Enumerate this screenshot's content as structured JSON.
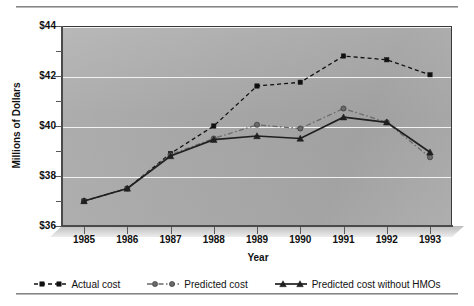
{
  "chart_data": {
    "type": "line",
    "title": "",
    "xlabel": "Year",
    "ylabel": "Millions of Dollars",
    "x": [
      1985,
      1986,
      1987,
      1988,
      1989,
      1990,
      1991,
      1992,
      1993
    ],
    "categories": [
      "1985",
      "1986",
      "1987",
      "1988",
      "1989",
      "1990",
      "1991",
      "1992",
      "1993"
    ],
    "xtick_labels": [
      "1985",
      "1986",
      "1987",
      "1988",
      "1989",
      "1990",
      "1991",
      "1992",
      "1993"
    ],
    "ytick_labels": [
      "$36",
      "$38",
      "$40",
      "$42",
      "$44"
    ],
    "ytick_values": [
      36,
      38,
      40,
      42,
      44
    ],
    "yminor_values": [
      37,
      39,
      41,
      43
    ],
    "ylim": [
      36,
      44
    ],
    "xlim": [
      1984.6,
      1993.5
    ],
    "grid": "horizontal",
    "legend_position": "bottom",
    "plot_background": "#a8a8a8",
    "series": [
      {
        "name": "Actual cost",
        "marker": "square",
        "linestyle": "dashed",
        "color": "#101010",
        "values": [
          37.0,
          37.5,
          38.9,
          40.0,
          41.6,
          41.75,
          42.8,
          42.65,
          42.05
        ]
      },
      {
        "name": "Predicted cost",
        "marker": "circle",
        "linestyle": "dash-dot",
        "color": "#6a6a6a",
        "values": [
          37.0,
          37.5,
          38.85,
          39.5,
          40.05,
          39.9,
          40.7,
          40.15,
          38.75
        ]
      },
      {
        "name": "Predicted cost without HMOs",
        "marker": "triangle",
        "linestyle": "solid",
        "color": "#202020",
        "values": [
          37.0,
          37.5,
          38.8,
          39.45,
          39.6,
          39.5,
          40.35,
          40.15,
          38.95
        ]
      }
    ]
  },
  "axes": {
    "y_title": "Millions of Dollars",
    "x_title": "Year"
  },
  "legend": {
    "items": [
      {
        "label": "Actual cost",
        "marker": "square",
        "linestyle": "dashed",
        "color": "#101010"
      },
      {
        "label": "Predicted cost",
        "marker": "circle",
        "linestyle": "dash-dot",
        "color": "#6a6a6a"
      },
      {
        "label": "Predicted cost without HMOs",
        "marker": "triangle",
        "linestyle": "solid",
        "color": "#202020"
      }
    ]
  }
}
